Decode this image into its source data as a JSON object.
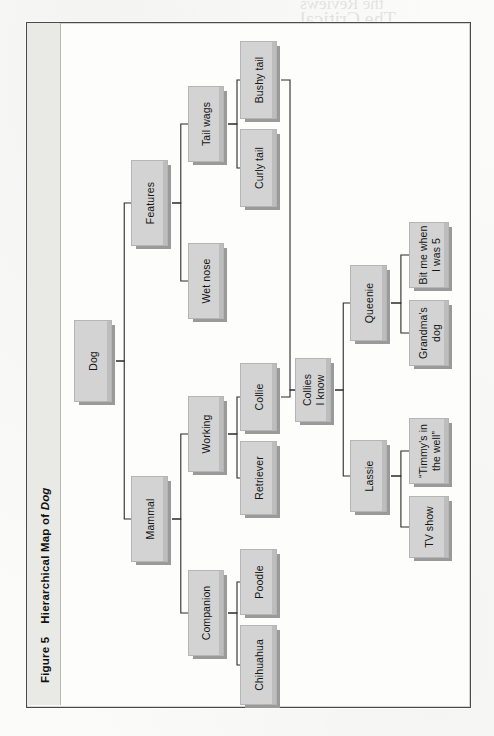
{
  "page": {
    "background_color": "#fbfbfa",
    "frame_border_color": "#4a4a4a",
    "caption_band_color": "#e9e9e6"
  },
  "caption": {
    "figure_label": "Figure 5",
    "title_plain": "Hierarchical Map of ",
    "title_italic": "Dog",
    "full": "Figure 5   Hierarchical Map of Dog"
  },
  "style": {
    "node_fill": "#d3d3d3",
    "node_border": "#b5b5b5",
    "node_shadow": "#9a9a9a",
    "link_color": "#2b2b2b",
    "text_color": "#161616"
  },
  "chart_data": {
    "type": "diagram",
    "diagram_kind": "hierarchical-map",
    "title": "Hierarchical Map of Dog",
    "orientation": "left-to-right, labels rotated 90 degrees counter-clockwise",
    "root": "Dog",
    "levels": 6,
    "node_count": 19,
    "nodes": [
      {
        "id": "dog",
        "label": "Dog",
        "level": 0,
        "x": 74,
        "y": 320,
        "w": 38,
        "h": 82
      },
      {
        "id": "features",
        "label": "Features",
        "level": 1,
        "x": 131,
        "y": 160,
        "w": 37,
        "h": 86
      },
      {
        "id": "mammal",
        "label": "Mammal",
        "level": 1,
        "x": 131,
        "y": 476,
        "w": 37,
        "h": 86
      },
      {
        "id": "tailwags",
        "label": "Tail wags",
        "level": 2,
        "x": 188,
        "y": 86,
        "w": 36,
        "h": 76
      },
      {
        "id": "wetnose",
        "label": "Wet nose",
        "level": 2,
        "x": 188,
        "y": 243,
        "w": 36,
        "h": 76
      },
      {
        "id": "working",
        "label": "Working",
        "level": 2,
        "x": 188,
        "y": 396,
        "w": 36,
        "h": 76
      },
      {
        "id": "companion",
        "label": "Companion",
        "level": 2,
        "x": 188,
        "y": 570,
        "w": 36,
        "h": 86
      },
      {
        "id": "bushytail",
        "label": "Bushy tail",
        "level": 3,
        "x": 240,
        "y": 41,
        "w": 37,
        "h": 78
      },
      {
        "id": "curlytail",
        "label": "Curly tail",
        "level": 3,
        "x": 240,
        "y": 129,
        "w": 37,
        "h": 78
      },
      {
        "id": "collie",
        "label": "Collie",
        "level": 3,
        "x": 240,
        "y": 363,
        "w": 37,
        "h": 68
      },
      {
        "id": "retriever",
        "label": "Retriever",
        "level": 3,
        "x": 240,
        "y": 441,
        "w": 37,
        "h": 74
      },
      {
        "id": "poodle",
        "label": "Poodle",
        "level": 3,
        "x": 240,
        "y": 549,
        "w": 37,
        "h": 66
      },
      {
        "id": "chihuahua",
        "label": "Chihuahua",
        "level": 3,
        "x": 240,
        "y": 625,
        "w": 37,
        "h": 80
      },
      {
        "id": "collies",
        "label": "Collies\nI know",
        "level": 4,
        "x": 295,
        "y": 358,
        "w": 36,
        "h": 64
      },
      {
        "id": "queenie",
        "label": "Queenie",
        "level": 5,
        "x": 350,
        "y": 265,
        "w": 37,
        "h": 76
      },
      {
        "id": "lassie",
        "label": "Lassie",
        "level": 5,
        "x": 350,
        "y": 440,
        "w": 37,
        "h": 72
      },
      {
        "id": "bitme",
        "label": "Bit me when\nI was 5",
        "level": 6,
        "x": 409,
        "y": 222,
        "w": 40,
        "h": 66
      },
      {
        "id": "grandma",
        "label": "Grandma's\ndog",
        "level": 6,
        "x": 409,
        "y": 300,
        "w": 40,
        "h": 66
      },
      {
        "id": "timmy",
        "label": "“Timmy's in\nthe well”",
        "level": 6,
        "x": 409,
        "y": 418,
        "w": 40,
        "h": 66
      },
      {
        "id": "tvshow",
        "label": "TV show",
        "level": 6,
        "x": 409,
        "y": 496,
        "w": 40,
        "h": 62
      }
    ],
    "edges": [
      {
        "from": "dog",
        "to": "features"
      },
      {
        "from": "dog",
        "to": "mammal"
      },
      {
        "from": "features",
        "to": "tailwags"
      },
      {
        "from": "features",
        "to": "wetnose"
      },
      {
        "from": "mammal",
        "to": "working"
      },
      {
        "from": "mammal",
        "to": "companion"
      },
      {
        "from": "tailwags",
        "to": "bushytail"
      },
      {
        "from": "tailwags",
        "to": "curlytail"
      },
      {
        "from": "working",
        "to": "collie"
      },
      {
        "from": "working",
        "to": "retriever"
      },
      {
        "from": "companion",
        "to": "poodle"
      },
      {
        "from": "companion",
        "to": "chihuahua"
      },
      {
        "from": "bushytail",
        "to": "collies"
      },
      {
        "from": "collie",
        "to": "collies"
      },
      {
        "from": "collies",
        "to": "queenie"
      },
      {
        "from": "collies",
        "to": "lassie"
      },
      {
        "from": "queenie",
        "to": "bitme"
      },
      {
        "from": "queenie",
        "to": "grandma"
      },
      {
        "from": "lassie",
        "to": "timmy"
      },
      {
        "from": "lassie",
        "to": "tvshow"
      }
    ]
  },
  "ghost_text": [
    {
      "text": "The Critical",
      "x": 300,
      "y": 8,
      "size": 20
    },
    {
      "text": "the Reviews",
      "x": 300,
      "y": -6,
      "size": 17
    }
  ]
}
